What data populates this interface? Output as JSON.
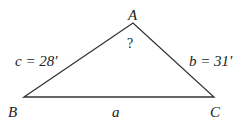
{
  "diagram": {
    "type": "triangle",
    "vertices": {
      "A": {
        "label": "A",
        "x": 133,
        "y": 23
      },
      "B": {
        "label": "B",
        "x": 24,
        "y": 97
      },
      "C": {
        "label": "C",
        "x": 214,
        "y": 97
      }
    },
    "sides": {
      "a": {
        "label": "a"
      },
      "b": {
        "label": "b = 31'"
      },
      "c": {
        "label": "c = 28'"
      }
    },
    "angle_A_label": "?",
    "stroke_color": "#333333"
  }
}
